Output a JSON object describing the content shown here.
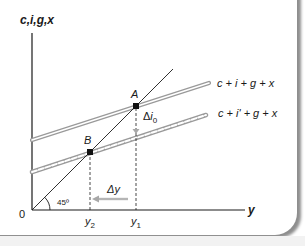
{
  "diagram": {
    "y_axis_label": "c,i,g,x",
    "x_axis_label": "y",
    "origin_label": "0",
    "angle_label": "45º",
    "lines": {
      "upper": {
        "label": "c + i + g + x",
        "style": "double-solid"
      },
      "lower": {
        "label": "c + i' + g + x",
        "style": "double-braided"
      },
      "reference": {
        "label": "45° line",
        "style": "thin-solid"
      }
    },
    "points": [
      {
        "name": "A",
        "label": "A"
      },
      {
        "name": "B",
        "label": "B"
      }
    ],
    "x_ticks": [
      {
        "label_base": "y",
        "label_sub": "2"
      },
      {
        "label_base": "y",
        "label_sub": "1"
      }
    ],
    "shift_labels": {
      "delta_i_prefix": "Δ",
      "delta_i_var": "i",
      "delta_i_sub": "0",
      "delta_y": "Δy"
    },
    "colors": {
      "axis": "#1a1a1a",
      "line_fill": "#ffffff",
      "line_stroke": "#9a9a9a",
      "arrow": "#a8a8a8",
      "frame_shadow": "#8e8e8e"
    }
  }
}
